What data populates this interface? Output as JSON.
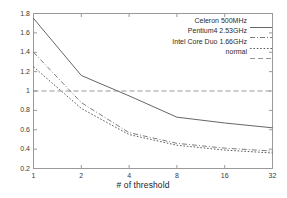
{
  "chart_data": {
    "type": "line",
    "title": "",
    "xlabel": "# of threshold",
    "ylabel": "",
    "xscale": "log2",
    "x": [
      1,
      2,
      4,
      8,
      16,
      32
    ],
    "xtick_labels": [
      "1",
      "2",
      "4",
      "8",
      "16",
      "32"
    ],
    "ytick_labels": [
      "0.2",
      "0.4",
      "0.6",
      "0.8",
      "1",
      "1.2",
      "1.4",
      "1.6",
      "1.8"
    ],
    "ytick_values": [
      0.2,
      0.4,
      0.6,
      0.8,
      1.0,
      1.2,
      1.4,
      1.6,
      1.8
    ],
    "xlim": [
      1,
      32
    ],
    "ylim": [
      0.2,
      1.8
    ],
    "grid": false,
    "legend_position": "top-right",
    "series": [
      {
        "name": "Celeron 500MHz",
        "style": "solid",
        "color": "#555555",
        "values": [
          1.75,
          1.16,
          0.95,
          0.73,
          0.67,
          0.62
        ]
      },
      {
        "name": "Pentium4 2.53GHz",
        "style": "dashdot",
        "color": "#6e6e6e",
        "values": [
          1.4,
          0.88,
          0.57,
          0.46,
          0.41,
          0.38
        ]
      },
      {
        "name": "Intel Core Duo 1.66GHz",
        "style": "dotted",
        "color": "#4a4a4a",
        "values": [
          1.25,
          0.82,
          0.55,
          0.44,
          0.39,
          0.36
        ]
      },
      {
        "name": "normal",
        "style": "dashed-reference",
        "color": "#8a8a8a",
        "values": [
          1.0,
          1.0,
          1.0,
          1.0,
          1.0,
          1.0
        ]
      }
    ]
  },
  "legend": {
    "entries": [
      {
        "label": "Celeron 500MHz"
      },
      {
        "label": "Pentium4 2.53GHz"
      },
      {
        "label": "Intel Core Duo 1.66GHz"
      },
      {
        "label": "normal"
      }
    ]
  },
  "axes": {
    "x_title": "# of threshold"
  },
  "colors": {
    "axis": "#9a9a9a",
    "text": "#2b2b2b",
    "background": "#ffffff"
  }
}
